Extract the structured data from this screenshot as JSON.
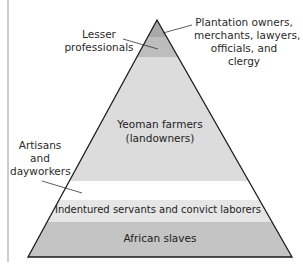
{
  "diagram": {
    "type": "pyramid",
    "colors": {
      "plantation": "#a9a9a9",
      "lesser_professionals": "#bdbdbd",
      "yeoman": "#dcdcdc",
      "artisans": "#ffffff",
      "indentured": "#e6e6e6",
      "slaves": "#c4c4c4",
      "outline": "#1a1a1a"
    },
    "layers": [
      {
        "id": "plantation",
        "label": "Plantation owners, merchants, lawyers, officials, and clergy",
        "callout": [
          "Plantation owners,",
          "merchants, lawyers,",
          "officials, and",
          "clergy"
        ]
      },
      {
        "id": "lesser_professionals",
        "label": "Lesser professionals",
        "callout": [
          "Lesser",
          "professionals"
        ]
      },
      {
        "id": "yeoman",
        "label": "Yeoman farmers (landowners)",
        "inline": [
          "Yeoman farmers",
          "(landowners)"
        ]
      },
      {
        "id": "artisans",
        "label": "Artisans and dayworkers",
        "callout": [
          "Artisans",
          "and",
          "dayworkers"
        ]
      },
      {
        "id": "indentured",
        "label": "Indentured servants and convict laborers"
      },
      {
        "id": "slaves",
        "label": "African slaves"
      }
    ]
  }
}
